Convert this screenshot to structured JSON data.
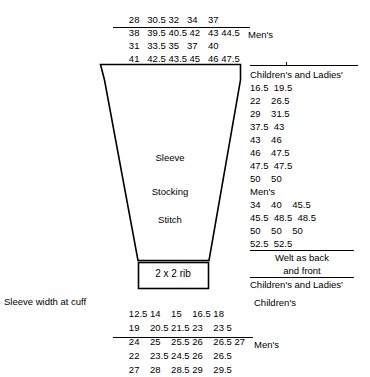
{
  "diagram": {
    "title_labels": {
      "sleeve": "Sleeve",
      "stocking": "Stocking",
      "stitch": "Stitch",
      "rib": "2 x 2 rib"
    },
    "sleeve_width_label": "Sleeve width at cuff"
  },
  "top_block": {
    "rows": [
      {
        "text": "28   30.5 32   34    37",
        "underline": false
      },
      {
        "text": "38   39.5 40.5 42   43 44.5",
        "underline": true
      },
      {
        "text": "31   33.5 35   37    40",
        "underline": false
      },
      {
        "text": "41   42.5 43.5 45   46 47.5",
        "underline": false
      }
    ],
    "mens_label": "Men's"
  },
  "right_block": {
    "header": "Children's and Ladies'",
    "rows_children": [
      "16.5  19.5",
      "22    26.5",
      "29    31.5",
      "37.5  43",
      "43    46",
      "46    47.5",
      "47.5  47.5",
      "50    50"
    ],
    "mens_header": "Men's",
    "rows_mens": [
      "34    40    45.5",
      "45.5  48.5  48.5",
      "50    50    50",
      "52.5  52.5"
    ],
    "welt_line1": "Welt as back",
    "welt_line2": "and front",
    "footer": "Children's and Ladies'"
  },
  "bottom_block": {
    "rows": [
      {
        "text": "12.5 14    15    16.5 18",
        "underline": false,
        "tag": "Children's"
      },
      {
        "text": "19    20.5 21.5 23    23 5",
        "underline": false,
        "tag": ""
      },
      {
        "text": "24    25    25.5 26    26.5 27",
        "underline": true,
        "tag": ""
      },
      {
        "text": "22    23.5 24.5 26    26.5",
        "underline": false,
        "tag": "Men's"
      },
      {
        "text": "27    28    28.5 29    29.5",
        "underline": false,
        "tag": ""
      }
    ]
  }
}
